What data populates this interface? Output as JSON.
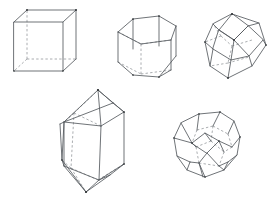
{
  "figure": {
    "background_color": "#ffffff",
    "solid_edge_color": "#555a5e",
    "hidden_edge_color": "#8d9195",
    "vertex_color": "#2d3134",
    "style": "wireframe line drawing, visible edges solid, hidden edges dashed",
    "projection": "oblique / parallel perspective",
    "shape_count": 5
  },
  "shapes": [
    {
      "id": "cube",
      "name": "cube",
      "label": "Cube",
      "row": "top",
      "position": "top-left",
      "faces": 6,
      "vertices": 8,
      "edges": 12,
      "bbox": {
        "x": 14,
        "y": 10,
        "width": 62,
        "height": 62
      },
      "front_face": [
        {
          "x": 14,
          "y": 22
        },
        {
          "x": 63,
          "y": 22
        },
        {
          "x": 63,
          "y": 71
        },
        {
          "x": 14,
          "y": 71
        }
      ],
      "back_face": [
        {
          "x": 27,
          "y": 10
        },
        {
          "x": 76,
          "y": 10
        },
        {
          "x": 76,
          "y": 59
        },
        {
          "x": 27,
          "y": 59
        }
      ],
      "hidden_vertex": {
        "x": 27,
        "y": 59
      },
      "hidden_edge_list": [
        "back-bottom-left to back-bottom-right",
        "back-bottom-left to front-bottom-left",
        "back-bottom-left to back-top-left"
      ]
    },
    {
      "id": "hexagonal-prism",
      "name": "hexagonal prism",
      "label": "Hexagonal prism",
      "row": "top",
      "position": "top-center",
      "faces": 8,
      "vertices": 12,
      "edges": 18,
      "bbox": {
        "x": 114,
        "y": 16,
        "width": 62,
        "height": 60
      },
      "top_face": [
        {
          "x": 118,
          "y": 32
        },
        {
          "x": 133,
          "y": 19
        },
        {
          "x": 159,
          "y": 16
        },
        {
          "x": 176,
          "y": 26
        },
        {
          "x": 171,
          "y": 40
        },
        {
          "x": 141,
          "y": 44
        }
      ],
      "bottom_face": [
        {
          "x": 118,
          "y": 62
        },
        {
          "x": 133,
          "y": 73
        },
        {
          "x": 159,
          "y": 75
        },
        {
          "x": 176,
          "y": 62
        },
        {
          "x": 171,
          "y": 50
        },
        {
          "x": 141,
          "y": 46
        }
      ],
      "hidden_edge_list": [
        "back top edge of top face",
        "back vertical edge",
        "back bottom edge of bottom face"
      ]
    },
    {
      "id": "rhombic-dodecahedron",
      "name": "rhombic dodecahedron",
      "label": "Rhombic dodecahedron",
      "row": "top",
      "position": "top-right",
      "faces": 12,
      "vertices": 14,
      "edges": 24,
      "bbox": {
        "x": 205,
        "y": 14,
        "width": 62,
        "height": 64
      },
      "outline": [
        {
          "x": 232,
          "y": 14
        },
        {
          "x": 259,
          "y": 23
        },
        {
          "x": 266,
          "y": 45
        },
        {
          "x": 252,
          "y": 66
        },
        {
          "x": 228,
          "y": 78
        },
        {
          "x": 210,
          "y": 66
        },
        {
          "x": 205,
          "y": 42
        },
        {
          "x": 213,
          "y": 24
        }
      ],
      "note": "three visible rhombic faces meeting at near-center vertex, hidden edges dashed"
    },
    {
      "id": "quartz-crystal",
      "name": "quartz crystal",
      "label": "Hexagonal prism with bipyramidal terminations",
      "row": "bottom",
      "position": "bottom-left",
      "faces": 20,
      "vertices": 14,
      "edges": 30,
      "bbox": {
        "x": 60,
        "y": 90,
        "width": 64,
        "height": 102
      },
      "apex_top": {
        "x": 98,
        "y": 90
      },
      "apex_bottom": {
        "x": 86,
        "y": 192
      },
      "note": "elongated hexagonal prism capped by pyramids top and bottom"
    },
    {
      "id": "truncated-octahedron",
      "name": "truncated octahedron",
      "label": "Truncated octahedron",
      "row": "bottom",
      "position": "bottom-right",
      "faces": 14,
      "vertices": 24,
      "edges": 36,
      "bbox": {
        "x": 174,
        "y": 112,
        "width": 66,
        "height": 68
      },
      "note": "square and hexagonal faces, near-spherical silhouette, hidden edges dashed"
    }
  ]
}
